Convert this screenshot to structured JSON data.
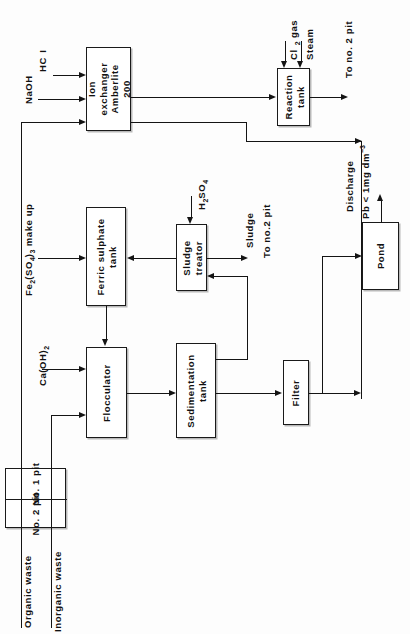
{
  "diagram": {
    "orientation": "rotated-90-ccw",
    "line_color": "#141414",
    "box_fill": "#ffffff",
    "background": "#fdfdfd"
  },
  "nodes": {
    "ion_exchanger": "Ion exchanger Amberlite 200",
    "reaction_tank": "Reaction tank",
    "ferric_sulphate_tank": "Ferric sulphate tank",
    "sludge_treator": "Sludge treator",
    "flocculator": "Flocculator",
    "sedimentation_tank": "Sedimentation tank",
    "filter": "Filter",
    "pond": "Pond",
    "pit_no_1": "No. 1 pit",
    "pit_no_2": "No. 2 pit"
  },
  "inputs": {
    "hcl": "HCl",
    "naoh": "NaOH",
    "ferric_sulphate_makeup": "Fe2(SO4)3 make up",
    "calcium_hydroxide": "Ca(OH)2",
    "sulphuric_acid": "H2SO4",
    "chlorine_gas": "Cl I2 gas",
    "steam": "Steam",
    "organic_waste": "Organic waste",
    "inorganic_waste": "Inorganic waste"
  },
  "outputs": {
    "reaction_tank_to_pit": "To no. 2 pit",
    "sludge": "Sludge",
    "sludge_to_pit": "To no.2 pit",
    "discharge_line1": "Discharge",
    "discharge_line2": "Pb < 1mg dm-3"
  }
}
